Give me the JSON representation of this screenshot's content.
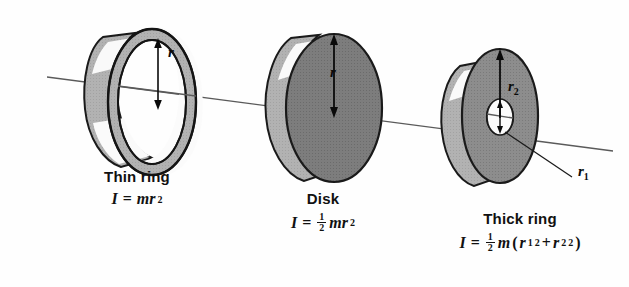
{
  "figure": {
    "title_present": false,
    "background_color": "#fefefe",
    "axis": {
      "name": "rotation-axis-line",
      "color": "#555555",
      "x1": 47,
      "y1": 77,
      "x2": 613,
      "y2": 151
    },
    "palette": {
      "outline": "#1a1a1a",
      "front_face_dark": "#787878",
      "front_face_mid": "#8a8a8a",
      "rim_light": "#b4b4b4",
      "rim_mid": "#9a9a9a",
      "highlight_white": "#f7f7f7",
      "hole_white": "#fbfbfb",
      "arrow": "#0a0a0a"
    }
  },
  "shapes": [
    {
      "id": "thin-ring",
      "name": "Thin ring",
      "radius_labels": [
        {
          "symbol": "r",
          "sub": "",
          "x": 171,
          "y": 52
        }
      ],
      "label": {
        "name_text": "Thin ring",
        "formula": {
          "lhs": "I",
          "equals": "=",
          "fraction": null,
          "terms": "mr",
          "exponent": "2",
          "full_text": "I = mr²"
        },
        "x": 74,
        "y": 168,
        "width": 126
      }
    },
    {
      "id": "disk",
      "name": "Disk",
      "radius_labels": [
        {
          "symbol": "r",
          "sub": "",
          "x": 332,
          "y": 72
        }
      ],
      "label": {
        "name_text": "Disk",
        "formula": {
          "lhs": "I",
          "equals": "=",
          "fraction": {
            "numerator": "1",
            "denominator": "2"
          },
          "terms": "mr",
          "exponent": "2",
          "full_text": "I = ½mr²"
        },
        "x": 253,
        "y": 190,
        "width": 140
      }
    },
    {
      "id": "thick-ring",
      "name": "Thick ring",
      "radius_labels": [
        {
          "symbol": "r",
          "sub": "2",
          "x": 512,
          "y": 86
        },
        {
          "symbol": "r",
          "sub": "1",
          "x": 581,
          "y": 171
        }
      ],
      "leader_line": {
        "name": "r1-leader-line",
        "x1": 512,
        "y1": 147,
        "x2": 572,
        "y2": 178
      },
      "label": {
        "name_text": "Thick ring",
        "formula": {
          "lhs": "I",
          "equals": "=",
          "fraction": {
            "numerator": "1",
            "denominator": "2"
          },
          "terms": "m",
          "group_open": "(",
          "term1": "r",
          "term1_sub": "1",
          "term1_exp": "2",
          "plus": "+",
          "term2": "r",
          "term2_sub": "2",
          "term2_exp": "2",
          "group_close": ")",
          "full_text": "I = ½m(r₁² + r₂²)"
        },
        "x": 425,
        "y": 210,
        "width": 190
      }
    }
  ]
}
